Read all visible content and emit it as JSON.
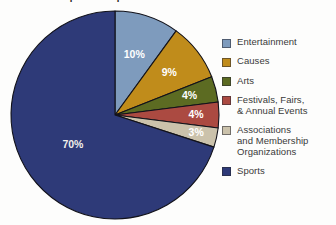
{
  "chart_data": {
    "type": "pie",
    "title": "Sponsorship Market",
    "xlabel": "",
    "ylabel": "",
    "legend_position": "right",
    "grid": false,
    "start_angle_deg": 0,
    "direction": "clockwise",
    "categories": [
      "Entertainment",
      "Causes",
      "Arts",
      "Festivals, Fairs, & Annual Events",
      "Associations and Membership Organizations",
      "Sports"
    ],
    "values": [
      10,
      9,
      4,
      4,
      3,
      70
    ],
    "value_labels": [
      "10%",
      "9%",
      "4%",
      "4%",
      "3%",
      "70%"
    ],
    "colors": [
      "#7e9bbd",
      "#c08c1b",
      "#5c6b22",
      "#ab4a41",
      "#cbc2ab",
      "#2e3a78"
    ],
    "slices": [
      {
        "label": "Entertainment",
        "value": 10,
        "display": "10%",
        "color": "#7e9bbd"
      },
      {
        "label": "Causes",
        "value": 9,
        "display": "9%",
        "color": "#c08c1b"
      },
      {
        "label": "Arts",
        "value": 4,
        "display": "4%",
        "color": "#5c6b22"
      },
      {
        "label": "Festivals, Fairs, & Annual Events",
        "value": 4,
        "display": "4%",
        "color": "#ab4a41"
      },
      {
        "label": "Associations and Membership Organizations",
        "value": 3,
        "display": "3%",
        "color": "#cbc2ab"
      },
      {
        "label": "Sports",
        "value": 70,
        "display": "70%",
        "color": "#2e3a78"
      }
    ]
  },
  "legend": {
    "items": [
      {
        "label": "Entertainment",
        "color": "#7e9bbd"
      },
      {
        "label": "Causes",
        "color": "#c08c1b"
      },
      {
        "label": "Arts",
        "color": "#5c6b22"
      },
      {
        "label": "Festivals, Fairs,\n& Annual Events",
        "color": "#ab4a41"
      },
      {
        "label": "Associations\nand Membership\nOrganizations",
        "color": "#cbc2ab"
      },
      {
        "label": "Sports",
        "color": "#2e3a78"
      }
    ]
  },
  "colors": {
    "background": "#fdfdfc",
    "title_text": "#1d1d1d",
    "legend_text": "#3a3a3a",
    "slice_outline": "#12121a",
    "slice_label_text": "#ffffff"
  }
}
